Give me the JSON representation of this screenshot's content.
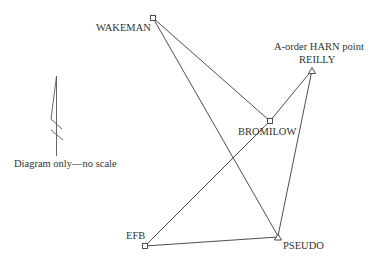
{
  "diagram": {
    "note": "Diagram only—no scale",
    "stations": [
      {
        "id": "wakeman",
        "name": "WAKEMAN",
        "symbol": "square",
        "x": 153,
        "y": 18
      },
      {
        "id": "reilly",
        "name": "REILLY",
        "symbol": "triangle",
        "x": 312,
        "y": 71,
        "annotation": "A-order HARN point"
      },
      {
        "id": "bromilow",
        "name": "BROMILOW",
        "symbol": "square",
        "x": 270,
        "y": 121
      },
      {
        "id": "efb",
        "name": "EFB",
        "symbol": "square",
        "x": 145,
        "y": 246
      },
      {
        "id": "pseudo",
        "name": "PSEUDO",
        "symbol": "triangle",
        "x": 278,
        "y": 237
      }
    ],
    "connections": [
      [
        "WAKEMAN",
        "BROMILOW"
      ],
      [
        "WAKEMAN",
        "PSEUDO"
      ],
      [
        "BROMILOW",
        "REILLY"
      ],
      [
        "BROMILOW",
        "EFB"
      ],
      [
        "REILLY",
        "PSEUDO"
      ],
      [
        "EFB",
        "PSEUDO"
      ]
    ],
    "labels": {
      "wakeman": "WAKEMAN",
      "reilly": "REILLY",
      "reilly_annotation": "A-order HARN point",
      "bromilow": "BROMILOW",
      "efb": "EFB",
      "pseudo": "PSEUDO"
    },
    "north_arrow": {
      "icon": "north-arrow-icon"
    }
  }
}
